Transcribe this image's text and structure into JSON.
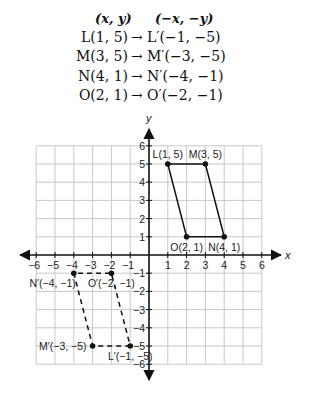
{
  "table": {
    "header_left": "(x, y)",
    "header_right": "(−x, −y)",
    "rows": [
      {
        "left": "L(1, 5)",
        "arrow": "→",
        "right": "L′(−1, −5)"
      },
      {
        "left": "M(3, 5)",
        "arrow": "→",
        "right": "M′(−3, −5)"
      },
      {
        "left": "N(4, 1)",
        "arrow": "→",
        "right": "N′(−4, −1)"
      },
      {
        "left": "O(2, 1)",
        "arrow": "→",
        "right": "O′(−2, −1)"
      }
    ]
  },
  "chart_data": {
    "type": "scatter",
    "title": "",
    "xlabel": "x",
    "ylabel": "y",
    "xlim": [
      -6,
      6
    ],
    "ylim": [
      -6,
      6
    ],
    "grid": true,
    "xticks": [
      -6,
      -5,
      -4,
      -3,
      -2,
      -1,
      1,
      2,
      3,
      4,
      5,
      6
    ],
    "yticks": [
      -6,
      -5,
      -4,
      -3,
      -2,
      -1,
      1,
      2,
      3,
      4,
      5,
      6
    ],
    "xtick_labels": [
      "−6",
      "−5",
      "−4",
      "−3",
      "−2",
      "−1",
      "1",
      "2",
      "3",
      "4",
      "5",
      "6"
    ],
    "ytick_labels": [
      "−6",
      "−5",
      "−4",
      "−3",
      "−2",
      "−1",
      "1",
      "2",
      "3",
      "4",
      "5",
      "6"
    ],
    "series": [
      {
        "name": "LMNO (original)",
        "style": "solid",
        "closed": true,
        "points": [
          {
            "label": "L(1, 5)",
            "x": 1,
            "y": 5,
            "label_pos": "above"
          },
          {
            "label": "M(3, 5)",
            "x": 3,
            "y": 5,
            "label_pos": "above"
          },
          {
            "label": "N(4, 1)",
            "x": 4,
            "y": 1,
            "label_pos": "below"
          },
          {
            "label": "O(2, 1)",
            "x": 2,
            "y": 1,
            "label_pos": "below"
          }
        ]
      },
      {
        "name": "L′M′N′O′ (rotated 180°)",
        "style": "dashed",
        "closed": true,
        "points": [
          {
            "label": "L′(−1, −5)",
            "x": -1,
            "y": -5,
            "label_pos": "below"
          },
          {
            "label": "M′(−3, −5)",
            "x": -3,
            "y": -5,
            "label_pos": "left"
          },
          {
            "label": "N′(−4, −1)",
            "x": -4,
            "y": -1,
            "label_pos": "below-left"
          },
          {
            "label": "O′(−2, −1)",
            "x": -2,
            "y": -1,
            "label_pos": "below"
          }
        ]
      }
    ]
  }
}
